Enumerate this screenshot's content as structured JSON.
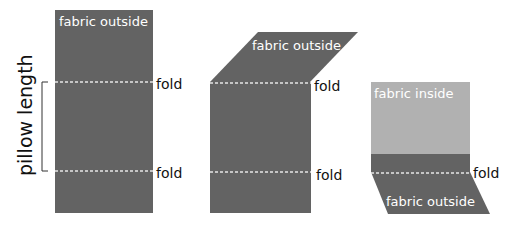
{
  "colors": {
    "fabric_outside": "#636363",
    "fabric_inside": "#b1b1b1",
    "fold_line": "#e6e6e6",
    "text_dark": "#111111",
    "text_light": "#ffffff"
  },
  "dimension": {
    "label": "pillow length"
  },
  "panels": [
    {
      "name": "step-1-flat",
      "top_label": "fabric outside",
      "folds": [
        "fold",
        "fold"
      ]
    },
    {
      "name": "step-2-top-folded",
      "top_label": "fabric outside",
      "folds": [
        "fold",
        "fold"
      ]
    },
    {
      "name": "step-3-bottom-folded",
      "inside_label": "fabric inside",
      "bottom_label": "fabric outside",
      "folds": [
        "fold"
      ]
    }
  ]
}
